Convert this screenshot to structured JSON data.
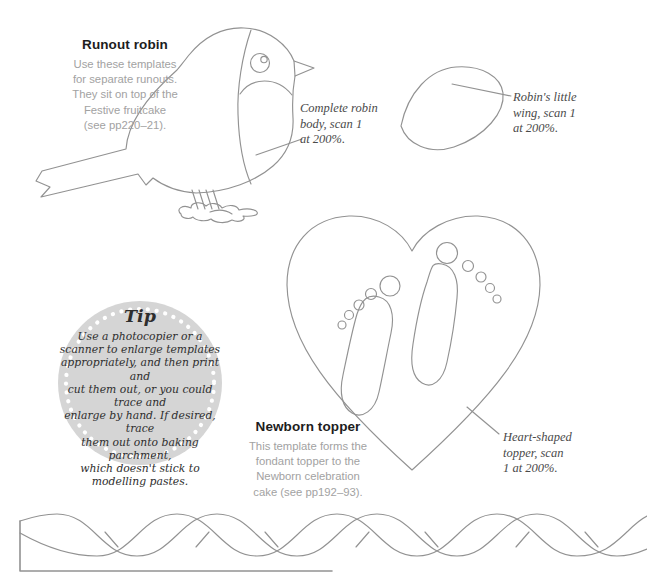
{
  "document": {
    "robin_section": {
      "heading": "Runout robin",
      "description_lines": [
        "Use these templates",
        "for separate runouts.",
        "They sit on top of the",
        "Festive fruitcake",
        "(see pp220–21)."
      ],
      "body_caption_lines": [
        "Complete robin",
        "body, scan 1",
        "at 200%."
      ],
      "wing_caption_lines": [
        "Robin's little",
        "wing, scan 1",
        "at 200%."
      ]
    },
    "tip_box": {
      "heading": "Tip",
      "text_lines": [
        "Use a photocopier or a",
        "scanner to enlarge templates",
        "appropriately, and then print and",
        "cut them out, or you could trace and",
        "enlarge by hand. If desired, trace",
        "them out onto baking parchment,",
        "which doesn't stick to",
        "modelling pastes."
      ],
      "circle_color": "#d5d5d5",
      "dot_color": "#ffffff"
    },
    "newborn_section": {
      "heading": "Newborn topper",
      "description_lines": [
        "This template forms the",
        "fondant topper to the",
        "Newborn celebration",
        "cake (see pp192–93)."
      ],
      "topper_caption_lines": [
        "Heart-shaped",
        "topper, scan",
        "1 at 200%."
      ]
    },
    "colors": {
      "line_art": "#929292",
      "heading_text": "#1d1d1d",
      "body_text": "#a2a2a2",
      "caption_text": "#4a4a4a"
    }
  }
}
